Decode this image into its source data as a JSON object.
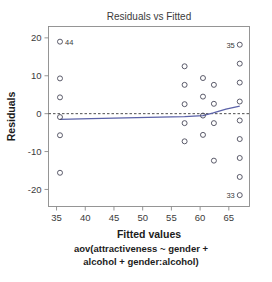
{
  "chart_data": {
    "type": "scatter",
    "title": "Residuals vs Fitted",
    "xlabel": "Fitted values",
    "ylabel": "Residuals",
    "caption_line1": "aov(attractiveness ~ gender +",
    "caption_line2": "alcohol + gender:alcohol)",
    "xlim": [
      33.6,
      68.6
    ],
    "ylim": [
      -24.5,
      23.0
    ],
    "xticks": [
      35,
      40,
      45,
      50,
      55,
      60,
      65
    ],
    "yticks": [
      20,
      10,
      0,
      -10,
      -20
    ],
    "grid": false,
    "legend": "none",
    "reference_line": {
      "type": "horizontal-dashed",
      "y": 0,
      "color": "#3a3a3a"
    },
    "smoother": {
      "name": "loess smoother",
      "color": "#5b62a8",
      "x": [
        35.6,
        41.0,
        47.0,
        53.0,
        57.3,
        60.5,
        62.3,
        64.5,
        66.9
      ],
      "y": [
        -1.5,
        -1.3,
        -1.1,
        -0.9,
        -0.8,
        -0.5,
        0.2,
        1.2,
        2.0
      ]
    },
    "points": [
      {
        "x": 35.6,
        "y": 19.0,
        "label": "44"
      },
      {
        "x": 35.6,
        "y": 9.3,
        "label": ""
      },
      {
        "x": 35.6,
        "y": 4.3,
        "label": ""
      },
      {
        "x": 35.6,
        "y": -0.9,
        "label": ""
      },
      {
        "x": 35.6,
        "y": -5.7,
        "label": ""
      },
      {
        "x": 35.6,
        "y": -15.6,
        "label": ""
      },
      {
        "x": 57.3,
        "y": 12.5,
        "label": ""
      },
      {
        "x": 57.3,
        "y": 7.6,
        "label": ""
      },
      {
        "x": 57.3,
        "y": 2.5,
        "label": ""
      },
      {
        "x": 57.3,
        "y": -2.5,
        "label": ""
      },
      {
        "x": 57.3,
        "y": -7.3,
        "label": ""
      },
      {
        "x": 60.5,
        "y": 9.4,
        "label": ""
      },
      {
        "x": 60.5,
        "y": 4.5,
        "label": ""
      },
      {
        "x": 60.5,
        "y": -0.5,
        "label": ""
      },
      {
        "x": 60.5,
        "y": -5.6,
        "label": ""
      },
      {
        "x": 62.4,
        "y": 7.6,
        "label": ""
      },
      {
        "x": 62.4,
        "y": 2.6,
        "label": ""
      },
      {
        "x": 62.4,
        "y": -2.5,
        "label": ""
      },
      {
        "x": 62.4,
        "y": -12.4,
        "label": ""
      },
      {
        "x": 66.9,
        "y": 18.2,
        "label": "35"
      },
      {
        "x": 66.9,
        "y": 13.2,
        "label": ""
      },
      {
        "x": 66.9,
        "y": 8.2,
        "label": ""
      },
      {
        "x": 66.9,
        "y": 3.2,
        "label": ""
      },
      {
        "x": 66.9,
        "y": -1.8,
        "label": ""
      },
      {
        "x": 66.9,
        "y": -6.7,
        "label": ""
      },
      {
        "x": 66.9,
        "y": -11.7,
        "label": ""
      },
      {
        "x": 66.9,
        "y": -16.7,
        "label": ""
      },
      {
        "x": 66.9,
        "y": -21.5,
        "label": "33"
      }
    ]
  }
}
